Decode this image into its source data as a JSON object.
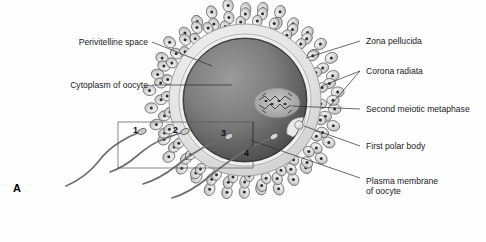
{
  "figure": {
    "panel_label": "A",
    "background_color": "#fefefe",
    "width": 486,
    "height": 242
  },
  "labels_left": [
    {
      "id": "perivitelline-space",
      "text": "Perivitelline space",
      "x": 148,
      "y": 45
    },
    {
      "id": "cytoplasm-of-oocyte",
      "text": "Cytoplasm of oocyte",
      "x": 148,
      "y": 88
    }
  ],
  "labels_right": [
    {
      "id": "zona-pellucida",
      "text": "Zona pellucida",
      "x": 366,
      "y": 44
    },
    {
      "id": "corona-radiata",
      "text": "Corona radiata",
      "x": 366,
      "y": 74
    },
    {
      "id": "second-meiotic-metaphase",
      "text": "Second meiotic metaphase",
      "x": 366,
      "y": 112
    },
    {
      "id": "first-polar-body",
      "text": "First polar body",
      "x": 366,
      "y": 149
    },
    {
      "id": "plasma-membrane-of-oocyte-line1",
      "text": "Plasma membrane",
      "x": 366,
      "y": 184
    },
    {
      "id": "plasma-membrane-of-oocyte-line2",
      "text": "of oocyte",
      "x": 366,
      "y": 194
    }
  ],
  "sperm_numbers": [
    {
      "id": "sperm-1",
      "text": "1",
      "x": 133,
      "y": 133
    },
    {
      "id": "sperm-2",
      "text": "2",
      "x": 173,
      "y": 133
    },
    {
      "id": "sperm-3",
      "text": "3",
      "x": 221,
      "y": 136
    },
    {
      "id": "sperm-4",
      "text": "4",
      "x": 244,
      "y": 156
    }
  ],
  "structure_colors": {
    "corona_cell_fill": "#d9d9d9",
    "corona_cell_stroke": "#5b5b5b",
    "corona_nucleus": "#2e2e2e",
    "zona_pellucida": "#e6e6e6",
    "perivitelline_space": "#efefef",
    "oocyte_cytoplasm_light": "#8f8f8f",
    "oocyte_cytoplasm_dark": "#4a4a4a",
    "spindle": "#b9b9b9",
    "polar_body": "#e3e3e3",
    "sperm": "#6e6e6e"
  },
  "diagram": {
    "inset_box": {
      "x": 118,
      "y": 122,
      "width": 135,
      "height": 46
    }
  }
}
